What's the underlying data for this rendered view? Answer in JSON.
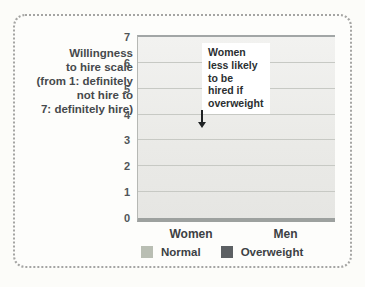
{
  "figure": {
    "y_axis_title": "Willingness\nto hire scale\n(from 1: definitely\nnot hire to\n7: definitely hire)",
    "annotation_text": "Women\nless likely\nto be\nhired if\noverweight"
  },
  "chart_data": {
    "type": "bar",
    "categories": [
      "Women",
      "Men"
    ],
    "series": [
      {
        "name": "Normal",
        "values": [
          5.5,
          5.85
        ],
        "color": "#b9beb3"
      },
      {
        "name": "Overweight",
        "values": [
          3.6,
          4.75
        ],
        "color": "#5c6063"
      }
    ],
    "title": "",
    "xlabel": "",
    "ylabel": "Willingness to hire scale (from 1: definitely not hire to 7: definitely hire)",
    "ylim": [
      0,
      7
    ],
    "yticks": [
      0,
      1,
      2,
      3,
      4,
      5,
      6,
      7
    ],
    "grid": true,
    "legend_position": "bottom",
    "annotation": {
      "text": "Women less likely to be hired if overweight",
      "points_to": "Women Overweight bar top"
    },
    "colors": {
      "normal_bar": "#b9beb3",
      "overweight_bar": "#5c6063",
      "plot_background": "#ebebe8",
      "gridline": "#c7c9c4",
      "text": "#3c4043"
    }
  }
}
